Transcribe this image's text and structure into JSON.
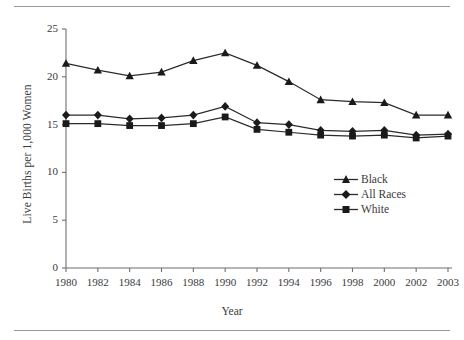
{
  "figure": {
    "top_rule": "",
    "bottom_rule": ""
  },
  "chart_data": {
    "type": "line",
    "title": "",
    "xlabel": "Year",
    "ylabel": "Live Births per 1,000 Women",
    "categories": [
      "1980",
      "1982",
      "1984",
      "1986",
      "1988",
      "1990",
      "1992",
      "1994",
      "1996",
      "1998",
      "2000",
      "2002",
      "2003"
    ],
    "x": [
      1980,
      1982,
      1984,
      1986,
      1988,
      1990,
      1992,
      1994,
      1996,
      1998,
      2000,
      2002,
      2003
    ],
    "ylim": [
      0,
      25
    ],
    "yticks": [
      "0",
      "5",
      "10",
      "15",
      "20",
      "25"
    ],
    "ytick_values": [
      0,
      5,
      10,
      15,
      20,
      25
    ],
    "xlim": [
      1980,
      2003
    ],
    "grid": false,
    "legend_position": "inside-lower-right",
    "series": [
      {
        "name": "Black",
        "marker": "triangle",
        "values": [
          21.4,
          20.7,
          20.1,
          20.5,
          21.7,
          22.5,
          21.2,
          19.5,
          17.6,
          17.4,
          17.3,
          16.0,
          16.0
        ]
      },
      {
        "name": "All Races",
        "marker": "diamond",
        "values": [
          16.0,
          16.0,
          15.6,
          15.7,
          16.0,
          16.9,
          15.2,
          15.0,
          14.4,
          14.3,
          14.4,
          13.9,
          14.0
        ]
      },
      {
        "name": "White",
        "marker": "square",
        "values": [
          15.1,
          15.1,
          14.9,
          14.9,
          15.1,
          15.8,
          14.5,
          14.2,
          13.9,
          13.8,
          13.9,
          13.6,
          13.8
        ]
      }
    ],
    "colors": {
      "line": "#2b2b2b",
      "marker": "#1a1a1a",
      "axis": "#6f6f6f",
      "text": "#3a3a3a",
      "rule": "#9a9a9a",
      "background": "#ffffff"
    }
  },
  "legend": {
    "items": [
      {
        "label": "Black",
        "marker": "triangle-marker-icon"
      },
      {
        "label": "All Races",
        "marker": "diamond-marker-icon"
      },
      {
        "label": "White",
        "marker": "square-marker-icon"
      }
    ]
  }
}
